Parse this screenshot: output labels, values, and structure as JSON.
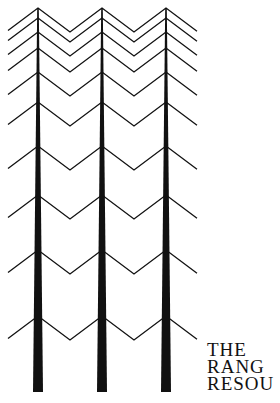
{
  "logo": {
    "description": "three stylized pine trees",
    "ink_color": "#111111",
    "trees": [
      {
        "trunk_x": 38
      },
      {
        "trunk_x": 102
      },
      {
        "trunk_x": 166
      }
    ],
    "branch_rows_y": [
      8,
      18,
      32,
      48,
      72,
      102,
      146,
      195,
      250,
      316
    ],
    "left_edge_x": 8,
    "right_edge_x": 197,
    "trunk_bottom_y": 392
  },
  "title": {
    "lines": [
      "THE",
      "RANG",
      "RESOU"
    ]
  }
}
